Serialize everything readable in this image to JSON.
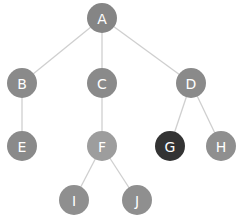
{
  "diagram": {
    "type": "tree",
    "colors": {
      "edge": "#cfcfcf",
      "default_node": "#8a8a8a",
      "light_node": "#9b9b9b",
      "highlight_node": "#333333"
    },
    "nodes": [
      {
        "id": "A",
        "label": "A",
        "color": "#858585"
      },
      {
        "id": "B",
        "label": "B",
        "color": "#8a8a8a"
      },
      {
        "id": "C",
        "label": "C",
        "color": "#8a8a8a"
      },
      {
        "id": "D",
        "label": "D",
        "color": "#8a8a8a"
      },
      {
        "id": "E",
        "label": "E",
        "color": "#8a8a8a"
      },
      {
        "id": "F",
        "label": "F",
        "color": "#9d9d9d"
      },
      {
        "id": "G",
        "label": "G",
        "color": "#333333"
      },
      {
        "id": "H",
        "label": "H",
        "color": "#8f8f8f"
      },
      {
        "id": "I",
        "label": "I",
        "color": "#8f8f8f"
      },
      {
        "id": "J",
        "label": "J",
        "color": "#8f8f8f"
      }
    ],
    "edges": [
      [
        "A",
        "B"
      ],
      [
        "A",
        "C"
      ],
      [
        "A",
        "D"
      ],
      [
        "B",
        "E"
      ],
      [
        "C",
        "F"
      ],
      [
        "D",
        "G"
      ],
      [
        "D",
        "H"
      ],
      [
        "F",
        "I"
      ],
      [
        "F",
        "J"
      ]
    ]
  }
}
